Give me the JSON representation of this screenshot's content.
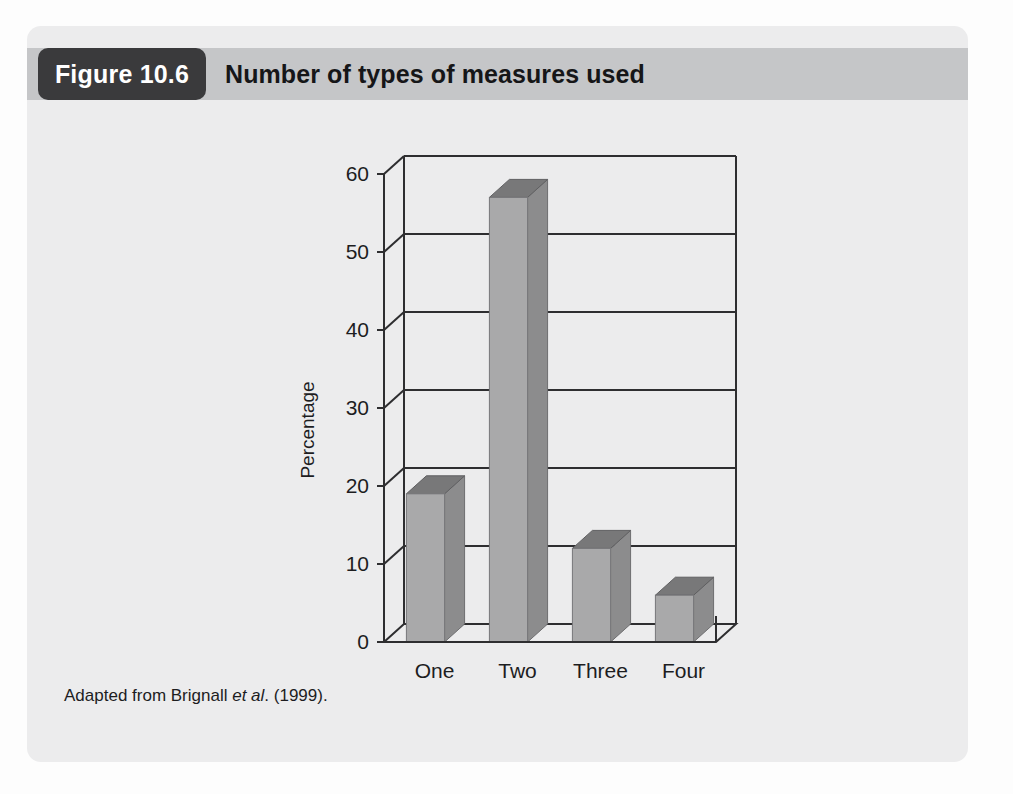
{
  "figure": {
    "badge_label": "Figure 10.6",
    "title": "Number of types of measures used",
    "caption_prefix": "Adapted from Brignall ",
    "caption_italic": "et al",
    "caption_suffix": ". (1999)."
  },
  "colors": {
    "card_background": "#ececed",
    "header_band": "#c5c6c8",
    "badge_background": "#3a3a3c",
    "badge_text": "#ffffff",
    "title_text": "#161618",
    "axis_line": "#2e2e30",
    "bar_front": "#a9a9aa",
    "bar_side": "#8c8c8d",
    "bar_top": "#787879",
    "plot_background": "#ececed"
  },
  "chart_data": {
    "type": "bar",
    "title": "Number of types of measures used",
    "xlabel": "",
    "ylabel": "Percentage",
    "categories": [
      "One",
      "Two",
      "Three",
      "Four"
    ],
    "values": [
      19,
      57,
      12,
      6
    ],
    "ylim": [
      0,
      60
    ],
    "yticks": [
      0,
      10,
      20,
      30,
      40,
      50,
      60
    ],
    "ytick_labels": [
      "0",
      "10",
      "20",
      "30",
      "40",
      "50",
      "60"
    ],
    "grid": true,
    "legend": "none",
    "three_d": true,
    "source_note": "Adapted from Brignall et al. (1999)."
  }
}
